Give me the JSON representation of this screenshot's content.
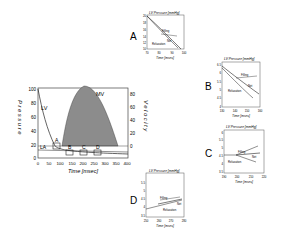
{
  "main_chart": {
    "y_left_label": "Pressure",
    "y_right_label": "Velocity",
    "x_label": "Time [msec]",
    "x_ticks": [
      "0",
      "50",
      "100",
      "150",
      "200",
      "250",
      "300",
      "350",
      "400"
    ],
    "y_left_ticks": [
      "0",
      "20",
      "40",
      "60",
      "80",
      "100"
    ],
    "y_right_ticks": [
      "0",
      "20",
      "40",
      "60",
      "80"
    ],
    "curve_labels": {
      "lv": "LV",
      "la": "LA",
      "mv": "MV"
    },
    "box_labels": [
      "A",
      "B",
      "C",
      "D"
    ],
    "fill_color": "#8c8c8c"
  },
  "insets": [
    {
      "id": "A",
      "panel_label": "A",
      "title": "LV Pressure [mmHg]",
      "x_label": "Time [msec]",
      "x_ticks": [
        "70",
        "80",
        "90",
        "100"
      ],
      "y_ticks": [
        "20",
        "18",
        "16",
        "14",
        "12",
        "10"
      ],
      "legend": [
        "Filling",
        "Net",
        "Relaxation"
      ]
    },
    {
      "id": "B",
      "panel_label": "B",
      "title": "LV Pressure [mmHg]",
      "x_label": "Time [msec]",
      "x_ticks": [
        "130",
        "140",
        "150",
        "160"
      ],
      "y_ticks": [
        "6.5",
        "6",
        "5.5",
        "5",
        "4.5",
        "4"
      ],
      "legend": [
        "Filling",
        "Net",
        "Relaxation"
      ]
    },
    {
      "id": "C",
      "panel_label": "C",
      "title": "LV Pressure [mmHg]",
      "x_label": "Time [msec]",
      "x_ticks": [
        "190",
        "200",
        "210",
        "220"
      ],
      "y_ticks": [
        "6",
        "5.5",
        "5",
        "4.5",
        "4",
        "3.5"
      ],
      "legend": [
        "Filling",
        "Net",
        "Relaxation"
      ]
    },
    {
      "id": "D",
      "panel_label": "D",
      "title": "LV Pressure [mmHg]",
      "x_label": "Time [msec]",
      "x_ticks": [
        "250",
        "260",
        "270",
        "280"
      ],
      "y_ticks": [
        "5.5",
        "5",
        "4.5",
        "4",
        "3.5"
      ],
      "legend": [
        "Filling",
        "Net",
        "Relaxation"
      ]
    }
  ]
}
